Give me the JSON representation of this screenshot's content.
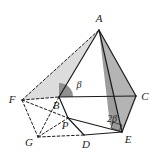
{
  "figure": {
    "canvas": {
      "width": 161,
      "height": 162,
      "background": "#ffffff"
    },
    "colors": {
      "stroke": "#1b1b1b",
      "label": "#1b1b1b",
      "shade_light": "#d9d9d9",
      "shade_mid": "#b3b3b3",
      "shade_dark": "#9a9a9a",
      "background": "#ffffff"
    },
    "vertices": [
      {
        "id": "A",
        "label": "A",
        "x": 99,
        "y": 30,
        "label_x": 99,
        "label_y": 19
      },
      {
        "id": "B",
        "label": "B",
        "x": 59,
        "y": 97,
        "label_x": 56,
        "label_y": 106
      },
      {
        "id": "C",
        "label": "C",
        "x": 136,
        "y": 96,
        "label_x": 145,
        "label_y": 97
      },
      {
        "id": "D",
        "label": "D",
        "x": 84,
        "y": 135,
        "label_x": 86,
        "label_y": 145
      },
      {
        "id": "E",
        "label": "E",
        "x": 122,
        "y": 132,
        "label_x": 128,
        "label_y": 140
      },
      {
        "id": "F",
        "label": "F",
        "x": 22,
        "y": 100,
        "label_x": 12,
        "label_y": 100
      },
      {
        "id": "G",
        "label": "G",
        "x": 38,
        "y": 137,
        "label_x": 29,
        "label_y": 143
      },
      {
        "id": "P",
        "label": "P",
        "x": 68,
        "y": 118,
        "label_x": 65,
        "label_y": 126
      }
    ],
    "angles": [
      {
        "id": "beta-at-B",
        "label": "β",
        "x": 79,
        "y": 86,
        "vertex": "B",
        "marker": "sector"
      },
      {
        "id": "two-beta-at-E",
        "label": "2β",
        "x": 112,
        "y": 120,
        "vertex": "E",
        "marker": "right-angle"
      }
    ],
    "edges_solid": [
      {
        "id": "A-B",
        "from": "A",
        "to": "B"
      },
      {
        "id": "A-C",
        "from": "A",
        "to": "C"
      },
      {
        "id": "A-E",
        "from": "A",
        "to": "E"
      },
      {
        "id": "B-C",
        "from": "B",
        "to": "C"
      },
      {
        "id": "B-P",
        "from": "B",
        "to": "P"
      },
      {
        "id": "P-D",
        "from": "P",
        "to": "D"
      },
      {
        "id": "P-E",
        "from": "P",
        "to": "E"
      },
      {
        "id": "D-E",
        "from": "D",
        "to": "E"
      },
      {
        "id": "E-C",
        "from": "E",
        "to": "C"
      }
    ],
    "edges_dashed": [
      {
        "id": "F-A",
        "from": "F",
        "to": "A"
      },
      {
        "id": "F-B",
        "from": "F",
        "to": "B"
      },
      {
        "id": "F-P",
        "from": "F",
        "to": "P"
      },
      {
        "id": "F-G",
        "from": "F",
        "to": "G"
      },
      {
        "id": "G-P",
        "from": "G",
        "to": "P"
      },
      {
        "id": "G-D",
        "from": "G",
        "to": "D"
      },
      {
        "id": "B-G",
        "from": "B",
        "to": "G"
      }
    ],
    "shaded_regions": [
      {
        "id": "face-F-B-A",
        "points": "22,100 59,97 99,30",
        "fill": "#d9d9d9"
      },
      {
        "id": "face-A-C-E",
        "points": "99,30 136,96 122,132",
        "fill": "#b0b0b0"
      },
      {
        "id": "face-A-E-B-strip",
        "points": "99,30 122,132 112,127",
        "fill": "#9a9a9a"
      }
    ]
  }
}
